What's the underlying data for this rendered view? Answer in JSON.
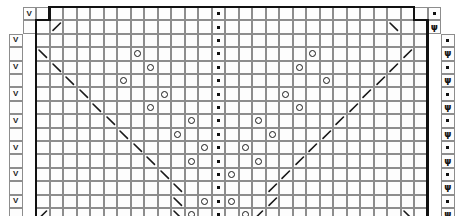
{
  "chart": {
    "type": "knitting-chart",
    "columns": 30,
    "rows": 16,
    "cell_width": 13.5,
    "cell_height": 13.4,
    "grid_origin": {
      "x": 9,
      "y": 7
    },
    "grid_line_color": "#8d8d8d",
    "symbol_color": "#1a1a1a",
    "outline_color": "#111111",
    "background": "#ffffff",
    "row_numbers": [
      "15",
      "13",
      "11",
      "9",
      "7",
      "5",
      "3",
      "1"
    ],
    "row_number_rows": [
      1,
      3,
      5,
      7,
      9,
      11,
      13,
      15
    ],
    "row_number_color": "#7a7a7a",
    "legend": {
      "purl": "purl stitch",
      "yo": "yarn over",
      "slip": "slip stitch",
      "psi": "double decrease",
      "dec_left": "ssk left-leaning decrease",
      "dec_right": "k2tog right-leaning decrease"
    },
    "symbols": [
      {
        "r": 0,
        "c": 1,
        "s": "v"
      },
      {
        "r": 0,
        "c": 15,
        "s": "purl"
      },
      {
        "r": 0,
        "c": 31,
        "s": "purl"
      },
      {
        "r": 1,
        "c": 3,
        "s": "decR"
      },
      {
        "r": 1,
        "c": 15,
        "s": "purl"
      },
      {
        "r": 1,
        "c": 28,
        "s": "decL"
      },
      {
        "r": 1,
        "c": 31,
        "s": "psi"
      },
      {
        "r": 2,
        "c": 0,
        "s": "v"
      },
      {
        "r": 2,
        "c": 15,
        "s": "purl"
      },
      {
        "r": 2,
        "c": 32,
        "s": "purl"
      },
      {
        "r": 3,
        "c": 2,
        "s": "decL"
      },
      {
        "r": 3,
        "c": 9,
        "s": "yo"
      },
      {
        "r": 3,
        "c": 15,
        "s": "purl"
      },
      {
        "r": 3,
        "c": 22,
        "s": "yo"
      },
      {
        "r": 3,
        "c": 29,
        "s": "decR"
      },
      {
        "r": 3,
        "c": 32,
        "s": "psi"
      },
      {
        "r": 4,
        "c": 0,
        "s": "v"
      },
      {
        "r": 4,
        "c": 3,
        "s": "decL"
      },
      {
        "r": 4,
        "c": 10,
        "s": "yo"
      },
      {
        "r": 4,
        "c": 15,
        "s": "purl"
      },
      {
        "r": 4,
        "c": 21,
        "s": "yo"
      },
      {
        "r": 4,
        "c": 28,
        "s": "decR"
      },
      {
        "r": 4,
        "c": 32,
        "s": "purl"
      },
      {
        "r": 5,
        "c": 4,
        "s": "decL"
      },
      {
        "r": 5,
        "c": 8,
        "s": "yo"
      },
      {
        "r": 5,
        "c": 15,
        "s": "purl"
      },
      {
        "r": 5,
        "c": 23,
        "s": "yo"
      },
      {
        "r": 5,
        "c": 27,
        "s": "decR"
      },
      {
        "r": 5,
        "c": 32,
        "s": "psi"
      },
      {
        "r": 6,
        "c": 0,
        "s": "v"
      },
      {
        "r": 6,
        "c": 5,
        "s": "decL"
      },
      {
        "r": 6,
        "c": 11,
        "s": "yo"
      },
      {
        "r": 6,
        "c": 15,
        "s": "purl"
      },
      {
        "r": 6,
        "c": 20,
        "s": "yo"
      },
      {
        "r": 6,
        "c": 26,
        "s": "decR"
      },
      {
        "r": 6,
        "c": 32,
        "s": "purl"
      },
      {
        "r": 7,
        "c": 6,
        "s": "decL"
      },
      {
        "r": 7,
        "c": 10,
        "s": "yo"
      },
      {
        "r": 7,
        "c": 15,
        "s": "purl"
      },
      {
        "r": 7,
        "c": 21,
        "s": "yo"
      },
      {
        "r": 7,
        "c": 25,
        "s": "decR"
      },
      {
        "r": 7,
        "c": 32,
        "s": "psi"
      },
      {
        "r": 8,
        "c": 0,
        "s": "v"
      },
      {
        "r": 8,
        "c": 7,
        "s": "decL"
      },
      {
        "r": 8,
        "c": 13,
        "s": "yo"
      },
      {
        "r": 8,
        "c": 15,
        "s": "purl"
      },
      {
        "r": 8,
        "c": 18,
        "s": "yo"
      },
      {
        "r": 8,
        "c": 24,
        "s": "decR"
      },
      {
        "r": 8,
        "c": 32,
        "s": "purl"
      },
      {
        "r": 9,
        "c": 8,
        "s": "decL"
      },
      {
        "r": 9,
        "c": 12,
        "s": "yo"
      },
      {
        "r": 9,
        "c": 15,
        "s": "purl"
      },
      {
        "r": 9,
        "c": 19,
        "s": "yo"
      },
      {
        "r": 9,
        "c": 23,
        "s": "decR"
      },
      {
        "r": 9,
        "c": 32,
        "s": "psi"
      },
      {
        "r": 10,
        "c": 0,
        "s": "v"
      },
      {
        "r": 10,
        "c": 9,
        "s": "decL"
      },
      {
        "r": 10,
        "c": 14,
        "s": "yo"
      },
      {
        "r": 10,
        "c": 15,
        "s": "purl"
      },
      {
        "r": 10,
        "c": 17,
        "s": "yo"
      },
      {
        "r": 10,
        "c": 22,
        "s": "decR"
      },
      {
        "r": 10,
        "c": 32,
        "s": "purl"
      },
      {
        "r": 11,
        "c": 10,
        "s": "decL"
      },
      {
        "r": 11,
        "c": 13,
        "s": "yo"
      },
      {
        "r": 11,
        "c": 15,
        "s": "purl"
      },
      {
        "r": 11,
        "c": 18,
        "s": "yo"
      },
      {
        "r": 11,
        "c": 21,
        "s": "decR"
      },
      {
        "r": 11,
        "c": 32,
        "s": "psi"
      },
      {
        "r": 12,
        "c": 0,
        "s": "v"
      },
      {
        "r": 12,
        "c": 11,
        "s": "decL"
      },
      {
        "r": 12,
        "c": 15,
        "s": "purl"
      },
      {
        "r": 12,
        "c": 16,
        "s": "yo"
      },
      {
        "r": 12,
        "c": 20,
        "s": "decR"
      },
      {
        "r": 12,
        "c": 32,
        "s": "purl"
      },
      {
        "r": 13,
        "c": 12,
        "s": "decL"
      },
      {
        "r": 13,
        "c": 15,
        "s": "purl"
      },
      {
        "r": 13,
        "c": 19,
        "s": "decR"
      },
      {
        "r": 13,
        "c": 32,
        "s": "psi"
      },
      {
        "r": 14,
        "c": 0,
        "s": "v"
      },
      {
        "r": 14,
        "c": 12,
        "s": "decL"
      },
      {
        "r": 14,
        "c": 14,
        "s": "yo"
      },
      {
        "r": 14,
        "c": 15,
        "s": "purl"
      },
      {
        "r": 14,
        "c": 16,
        "s": "yo"
      },
      {
        "r": 14,
        "c": 19,
        "s": "decR"
      },
      {
        "r": 14,
        "c": 32,
        "s": "purl"
      },
      {
        "r": 15,
        "c": 2,
        "s": "decR"
      },
      {
        "r": 15,
        "c": 12,
        "s": "decL"
      },
      {
        "r": 15,
        "c": 13,
        "s": "yo"
      },
      {
        "r": 15,
        "c": 15,
        "s": "purl"
      },
      {
        "r": 15,
        "c": 17,
        "s": "yo"
      },
      {
        "r": 15,
        "c": 18,
        "s": "decR"
      },
      {
        "r": 15,
        "c": 29,
        "s": "decL"
      },
      {
        "r": 15,
        "c": 32,
        "s": "psi"
      }
    ]
  }
}
